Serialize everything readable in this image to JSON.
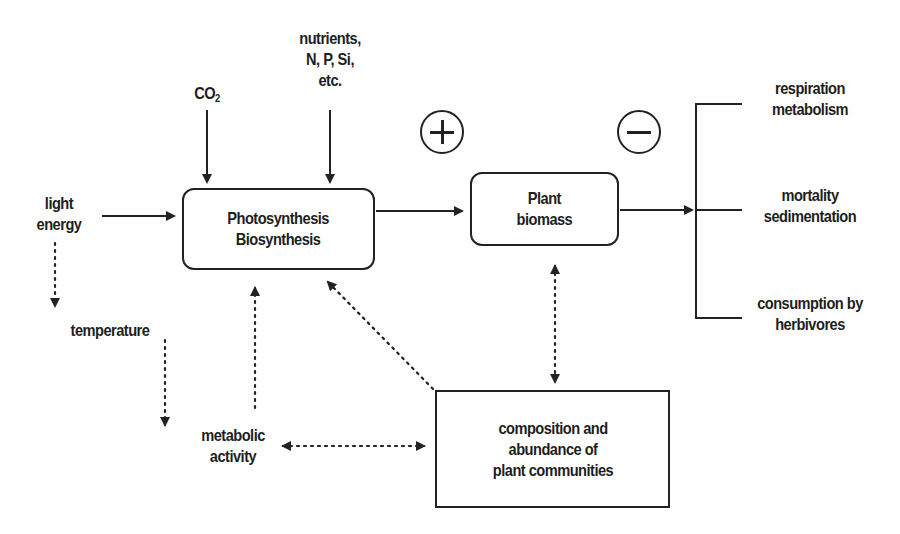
{
  "diagram": {
    "type": "flow",
    "nodes": {
      "co2": {
        "label": "CO",
        "subscript": "2"
      },
      "nutrients": {
        "line1": "nutrients,",
        "line2": "N, P, Si,",
        "line3": "etc."
      },
      "light_energy": {
        "line1": "light",
        "line2": "energy"
      },
      "photosynthesis_box": {
        "line1": "Photosynthesis",
        "line2": "Biosynthesis"
      },
      "plant_biomass_box": {
        "line1": "Plant",
        "line2": "biomass"
      },
      "temperature": {
        "label": "temperature"
      },
      "metabolic_activity": {
        "line1": "metabolic",
        "line2": "activity"
      },
      "communities_box": {
        "line1": "composition and",
        "line2": "abundance of",
        "line3": "plant communities"
      },
      "losses": [
        {
          "line1": "respiration",
          "line2": "metabolism"
        },
        {
          "line1": "mortality",
          "line2": "sedimentation"
        },
        {
          "line1": "consumption by",
          "line2": "herbivores"
        }
      ]
    },
    "signs": {
      "positive": "+",
      "negative": "−"
    },
    "edges": [
      {
        "from": "light_energy",
        "to": "photosynthesis_box",
        "style": "solid"
      },
      {
        "from": "co2",
        "to": "photosynthesis_box",
        "style": "solid"
      },
      {
        "from": "nutrients",
        "to": "photosynthesis_box",
        "style": "solid"
      },
      {
        "from": "photosynthesis_box",
        "to": "plant_biomass_box",
        "style": "solid"
      },
      {
        "from": "plant_biomass_box",
        "to": "losses",
        "style": "solid"
      },
      {
        "from": "light_energy",
        "to": "temperature",
        "style": "dotted"
      },
      {
        "from": "temperature",
        "to": "metabolic_activity",
        "style": "dotted"
      },
      {
        "from": "metabolic_activity",
        "to": "photosynthesis_box",
        "style": "dotted"
      },
      {
        "from": "communities_box",
        "to": "photosynthesis_box",
        "style": "dotted"
      },
      {
        "from": "plant_biomass_box",
        "to": "communities_box",
        "style": "dotted",
        "bidirectional": true
      },
      {
        "from": "metabolic_activity",
        "to": "communities_box",
        "style": "dotted",
        "bidirectional": true
      }
    ]
  }
}
